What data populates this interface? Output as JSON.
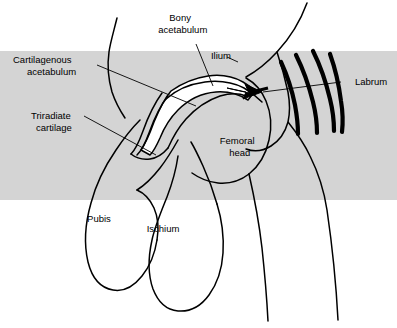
{
  "figure": {
    "background_color": "#ffffff",
    "band_color": "#d4d4d4",
    "ink_color": "#000000",
    "cartilage_fill": "#ffffff",
    "width": 397,
    "height": 328
  },
  "labels": {
    "bony_acetabulum_line1": "Bony",
    "bony_acetabulum_line2": "acetabulum",
    "ilium": "Ilium",
    "cartilagenous_line1": "Cartilagenous",
    "cartilagenous_line2": "acetabulum",
    "triradiate_line1": "Triradiate",
    "triradiate_line2": "cartilage",
    "labrum": "Labrum",
    "femoral_head_line1": "Femoral",
    "femoral_head_line2": "head",
    "pubis": "Pubis",
    "ischium": "Ischium"
  },
  "shapes": {
    "ilium_upper_left_edge": "M 117 18 C 113 34 110 44 109 52 C 107 66 108 78 112 92 C 116 104 121 112 125 118",
    "ilium_right_edge": "M 307 3 C 300 22 290 38 277 52 C 266 64 255 72 246 77",
    "ilium_acetabular_roof": "M 171 92 C 180 85 193 79 206 77 C 220 75 232 77 241 81",
    "bony_acetabulum_inner": "M 166 99 C 176 90 190 84 205 82 C 221 80 234 83 244 88 C 251 92 257 97 262 102",
    "acetabulum_white_cartilage": "M 171 91 C 181 84 194 78 208 76 C 222 74 234 77 243 82 C 248 85 252 88 255 91 L 248 100 C 240 95 229 91 216 92 C 202 93 188 100 178 110 C 170 118 164 128 160 138 C 156 147 153 152 150 155 L 141 150 C 146 143 150 133 154 122 C 159 110 164 99 171 91 Z",
    "cartilage_lower_tip": "M 150 155 C 147 158 144 159 141 158 L 141 150 C 144 151 147 153 150 155 Z",
    "acetabulum_outer_dark": "M 168 96 C 160 106 154 119 149 133 C 145 144 141 151 137 155",
    "acetabulum_outer_dark2": "M 162 93 C 154 104 148 117 143 131 C 139 142 135 150 131 154",
    "triradiate_stem": "M 131 154 C 136 158 143 160 150 159 C 157 158 163 154 168 148",
    "femoral_head_top": "M 246 78 C 255 83 262 91 266 101 C 271 113 272 127 269 140 C 266 154 259 166 249 174",
    "femoral_head_left": "M 168 148 C 172 139 178 128 186 119 C 196 108 208 100 220 96 C 230 93 239 93 246 96",
    "femoral_neck_lower": "M 249 174 C 240 181 229 184 218 183 C 208 182 199 178 192 173",
    "greater_troch_outline": "M 277 52 C 281 64 285 78 288 92 C 290 103 290 113 288 122 C 285 133 279 141 271 146 C 263 151 254 152 246 149",
    "femur_shaft_right": "M 288 122 C 296 132 304 143 310 156 C 318 172 324 190 327 210 C 332 244 336 282 338 320",
    "femur_shaft_left": "M 249 174 C 254 196 259 222 262 248 C 265 276 267 302 268 321",
    "pubis_loop": "M 140 120 C 132 128 124 138 116 150 C 105 166 96 184 91 203 C 85 224 84 245 88 262 C 92 278 101 288 113 290 C 124 292 134 286 142 276 C 150 266 155 253 157 240",
    "pubis_inner": "M 157 240 C 159 228 158 217 154 208 C 150 199 144 193 137 190",
    "ischium_loop": "M 178 156 C 176 170 172 184 167 197 C 161 212 155 226 152 240 C 148 258 148 275 153 289 C 158 302 167 310 178 311 C 190 312 201 306 209 295 C 217 284 222 269 223 253 C 224 237 222 220 217 204",
    "ischium_upper": "M 217 204 C 213 190 208 177 203 166 C 198 155 194 147 191 142",
    "ischio_pubic_junction": "M 137 190 C 145 185 153 177 160 168 C 167 159 173 149 178 140"
  },
  "labrum_hatching": [
    "M 281 62 C 287 75 292 90 295 105 C 297 116 298 126 298 134",
    "M 296 55 C 303 69 309 86 313 102 C 316 114 317 124 317 133",
    "M 313 51 C 320 65 326 82 330 99 C 333 111 334 122 334 131",
    "M 330 54 C 335 68 339 85 341 101 C 343 113 343 123 342 132"
  ],
  "arrow": {
    "name": "joint-direction-arrow",
    "path": "M 227 88 L 249 93 L 245 84 L 262 92 L 243 99 L 246 92 Z",
    "shaft": "M 252 92 L 268 88"
  },
  "leaders": {
    "bony_acetabulum": "M 196 44 L 213 86",
    "ilium": "M 227 57 L 238 62",
    "cartilagenous_acetabulum": "M 97 65 L 196 106",
    "triradiate_cartilage": "M 84 116 L 156 155",
    "labrum": "M 341 82 L 263 92"
  },
  "band": {
    "x": 0,
    "y": 51,
    "width": 397,
    "height": 149
  },
  "label_positions": {
    "bony_acetabulum": {
      "x": 192,
      "y": 21
    },
    "ilium": {
      "x": 221,
      "y": 59
    },
    "cartilagenous_acetabulum": {
      "x": 48,
      "y": 63
    },
    "triradiate_cartilage": {
      "x": 62,
      "y": 119
    },
    "labrum": {
      "x": 355,
      "y": 85
    },
    "femoral_head": {
      "x": 249,
      "y": 144
    },
    "pubis": {
      "x": 99,
      "y": 222
    },
    "ischium": {
      "x": 163,
      "y": 232
    }
  }
}
